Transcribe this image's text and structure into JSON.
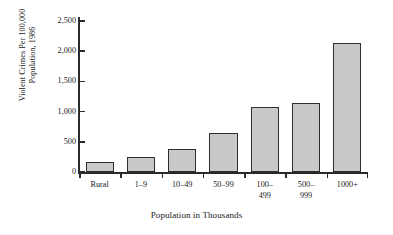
{
  "chart_data": {
    "type": "bar",
    "title": "",
    "subtitle": "",
    "categories": [
      "Rural",
      "1–9",
      "10–49",
      "50–99",
      "100–499",
      "500–999",
      "1000+"
    ],
    "category_lines": [
      [
        "Rural"
      ],
      [
        "1–9"
      ],
      [
        "10–49"
      ],
      [
        "50–99"
      ],
      [
        "100–",
        "499"
      ],
      [
        "500–",
        "999"
      ],
      [
        "1000+"
      ]
    ],
    "values": [
      165,
      250,
      380,
      645,
      1075,
      1145,
      2135
    ],
    "xlabel": "Population in Thousands",
    "ylabel": "Violent Crimes Per 100,000 Population, 1986",
    "ylabel_lines": [
      "Violent Crimes Per 100,000",
      "Population, 1986"
    ],
    "ylim": [
      0,
      2500
    ],
    "yticks": [
      0,
      500,
      1000,
      1500,
      2000,
      2500
    ],
    "ytick_labels": [
      "0",
      "500",
      "1,000",
      "1,500",
      "2,000",
      "2,500"
    ],
    "grid": false,
    "legend": null,
    "bar_fill_color": "#c9c9c9",
    "bar_edge_color": "#2e2e2e",
    "axis_color": "#2a2a2a",
    "background_color": "#ffffff"
  }
}
